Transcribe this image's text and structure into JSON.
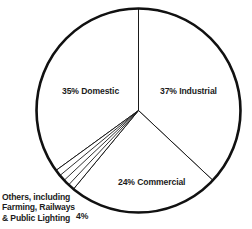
{
  "chart_data": {
    "type": "pie",
    "title": "",
    "subtitle": "",
    "xlabel": "",
    "ylabel": "",
    "legend_position": "inline-labels",
    "grid": false,
    "total_percent": 100,
    "categories": [
      "Industrial",
      "Commercial",
      "Others, including Farming, Railways & Public Lighting",
      "Domestic"
    ],
    "values": [
      37,
      24,
      4,
      35
    ],
    "slices": [
      {
        "name": "Industrial",
        "value": 37,
        "label": "37% Industrial",
        "percent_text": "37%",
        "start_angle_deg": 0,
        "end_angle_deg": 133.2,
        "fill": "#ffffff",
        "stroke": "#1a1a1a"
      },
      {
        "name": "Commercial",
        "value": 24,
        "label": "24% Commercial",
        "percent_text": "24%",
        "start_angle_deg": 133.2,
        "end_angle_deg": 219.6,
        "fill": "#ffffff",
        "stroke": "#1a1a1a"
      },
      {
        "name": "Others",
        "value": 4,
        "label": "4%",
        "percent_text": "4%",
        "start_angle_deg": 219.6,
        "end_angle_deg": 234.0,
        "fill": "#ffffff",
        "stroke": "#1a1a1a",
        "sub_divisions": 4,
        "callout_lines": [
          "Others, including",
          "Farming, Railways",
          "& Public Lighting"
        ]
      },
      {
        "name": "Domestic",
        "value": 35,
        "label": "35% Domestic",
        "percent_text": "35%",
        "start_angle_deg": 234.0,
        "end_angle_deg": 360,
        "fill": "#ffffff",
        "stroke": "#1a1a1a"
      }
    ]
  },
  "labels": {
    "domestic": "35% Domestic",
    "industrial": "37% Industrial",
    "commercial": "24% Commercial",
    "others_percent": "4%",
    "others_line_1": "Others, including",
    "others_line_2": "Farming, Railways",
    "others_line_3": "& Public Lighting"
  },
  "colors": {
    "background": "#ffffff",
    "outline": "#111111",
    "divider": "#1a1a1a",
    "text": "#1b1b1b"
  },
  "geometry": {
    "center_x": 138.5,
    "center_y": 110.5,
    "radius": 102
  }
}
